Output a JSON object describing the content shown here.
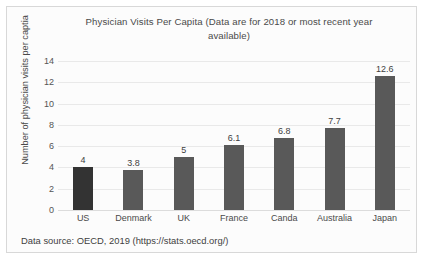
{
  "chart_data": {
    "type": "bar",
    "title": "Physician Visits Per Capita (Data are for 2018 or most recent year available)",
    "title_line1": "Physician Visits Per Capita (Data are for 2018 or most recent year",
    "title_line2": "available)",
    "categories": [
      "US",
      "Denmark",
      "UK",
      "France",
      "Canda",
      "Australia",
      "Japan"
    ],
    "values": [
      4,
      3.8,
      5,
      6.1,
      6.8,
      7.7,
      12.6
    ],
    "value_labels": [
      "4",
      "3.8",
      "5",
      "6.1",
      "6.8",
      "7.7",
      "12.6"
    ],
    "bar_colors": [
      "#333333",
      "#595959",
      "#595959",
      "#595959",
      "#595959",
      "#595959",
      "#595959"
    ],
    "xlabel": "",
    "ylabel": "Number of physician visits per captia",
    "ylim": [
      0,
      14
    ],
    "y_ticks": [
      "0",
      "2",
      "4",
      "6",
      "8",
      "10",
      "12",
      "14"
    ],
    "y_tick_values": [
      0,
      2,
      4,
      6,
      8,
      10,
      12,
      14
    ],
    "grid": "horizontal",
    "legend": "none",
    "source_note": "Data source: OECD, 2019 (https://stats.oecd.org/)"
  },
  "colors": {
    "bar_primary": "#595959",
    "bar_highlight": "#333333",
    "gridline": "#e9e9e9",
    "frame_border": "#d8d8d8",
    "plot_background": "#fcfcfc",
    "text": "#4a4a4a"
  }
}
